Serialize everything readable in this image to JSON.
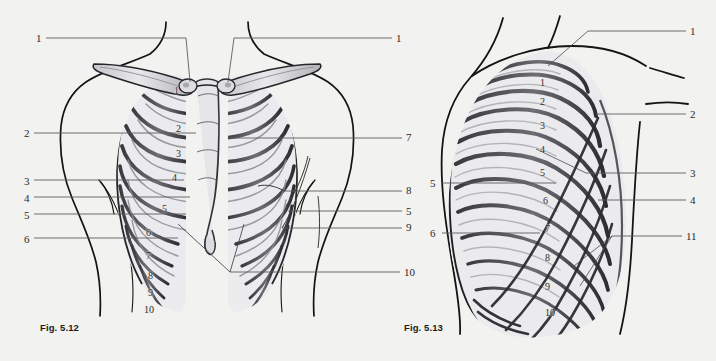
{
  "page": {
    "background_color": "#f2f2f0",
    "ink_color": "#1b1b1b",
    "leader_color": "#575757",
    "bone_fill": "#e4e4e6",
    "bone_shade": "#9a9a9f"
  },
  "figures": [
    {
      "id": "fig-5-12",
      "caption": "Fig. 5.12",
      "view": "anterior thorax with clavicles and sternum",
      "left_labels": [
        {
          "text": "1",
          "x": 36,
          "y": 33
        },
        {
          "text": "2",
          "x": 24,
          "y": 128
        },
        {
          "text": "3",
          "x": 24,
          "y": 176
        },
        {
          "text": "4",
          "x": 24,
          "y": 193
        },
        {
          "text": "5",
          "x": 24,
          "y": 210
        },
        {
          "text": "6",
          "x": 24,
          "y": 234
        }
      ],
      "right_labels": [
        {
          "text": "1",
          "x": 396,
          "y": 33
        },
        {
          "text": "7",
          "x": 406,
          "y": 132
        },
        {
          "text": "8",
          "x": 406,
          "y": 185
        },
        {
          "text": "5",
          "x": 406,
          "y": 206
        },
        {
          "text": "9",
          "x": 406,
          "y": 222
        },
        {
          "text": "10",
          "x": 404,
          "y": 267
        }
      ],
      "rib_numbers_left_half": [
        {
          "text": "1",
          "x": 174,
          "y": 86
        },
        {
          "text": "2",
          "x": 176,
          "y": 124
        },
        {
          "text": "3",
          "x": 176,
          "y": 149
        },
        {
          "text": "4",
          "x": 172,
          "y": 173
        },
        {
          "text": "5",
          "x": 162,
          "y": 204
        },
        {
          "text": "6",
          "x": 146,
          "y": 228
        },
        {
          "text": "7",
          "x": 146,
          "y": 251
        },
        {
          "text": "8",
          "x": 148,
          "y": 271
        },
        {
          "text": "9",
          "x": 148,
          "y": 288
        },
        {
          "text": "10",
          "x": 144,
          "y": 305
        }
      ]
    },
    {
      "id": "fig-5-13",
      "caption": "Fig. 5.13",
      "view": "lateral oblique thorax",
      "left_labels": [
        {
          "text": "5",
          "x": 430,
          "y": 178
        },
        {
          "text": "6",
          "x": 430,
          "y": 228
        }
      ],
      "right_labels": [
        {
          "text": "1",
          "x": 690,
          "y": 26
        },
        {
          "text": "2",
          "x": 690,
          "y": 109
        },
        {
          "text": "3",
          "x": 690,
          "y": 168
        },
        {
          "text": "4",
          "x": 690,
          "y": 195
        },
        {
          "text": "11",
          "x": 686,
          "y": 231
        }
      ],
      "rib_numbers": [
        {
          "text": "1",
          "x": 540,
          "y": 78
        },
        {
          "text": "2",
          "x": 540,
          "y": 97
        },
        {
          "text": "3",
          "x": 540,
          "y": 121
        },
        {
          "text": "4",
          "x": 540,
          "y": 145
        },
        {
          "text": "5",
          "x": 540,
          "y": 168
        },
        {
          "text": "6",
          "x": 543,
          "y": 196
        },
        {
          "text": "7",
          "x": 545,
          "y": 224
        },
        {
          "text": "8",
          "x": 545,
          "y": 253
        },
        {
          "text": "9",
          "x": 545,
          "y": 282
        },
        {
          "text": "10",
          "x": 545,
          "y": 308
        }
      ]
    }
  ]
}
